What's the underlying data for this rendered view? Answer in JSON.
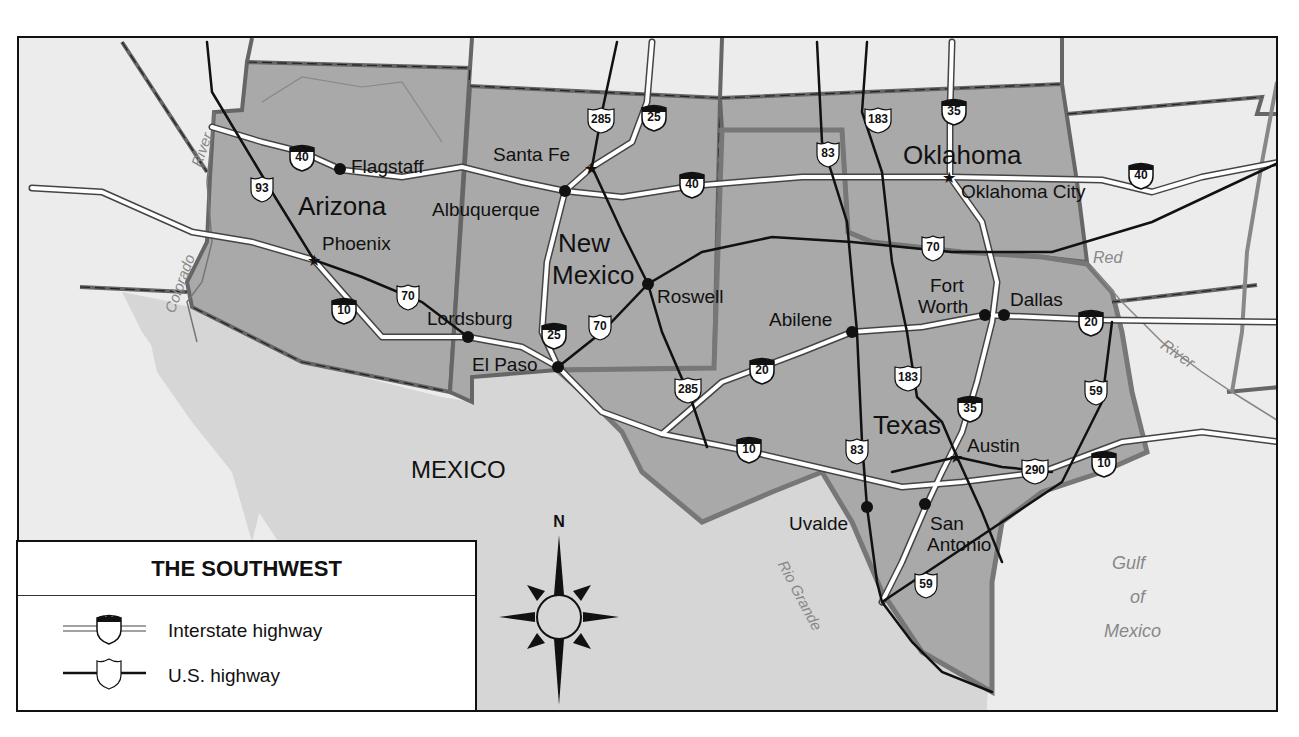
{
  "map": {
    "title": "THE SOUTHWEST",
    "colors": {
      "highlighted_states": "#a9a9a9",
      "neighbor_states": "#ececec",
      "mexico": "#d6d6d6",
      "water": "#ececec",
      "interstate_road": "#ffffff",
      "us_highway": "#111111",
      "border": "#555555",
      "river": "#888888"
    },
    "states": [
      {
        "id": "arizona",
        "label": "Arizona"
      },
      {
        "id": "new-mexico",
        "label_line1": "New",
        "label_line2": "Mexico"
      },
      {
        "id": "oklahoma",
        "label": "Oklahoma"
      },
      {
        "id": "texas",
        "label": "Texas"
      }
    ],
    "country_label": "MEXICO",
    "water_labels": {
      "gulf_line1": "Gulf",
      "gulf_line2": "of",
      "gulf_line3": "Mexico",
      "colorado_river_1": "River",
      "colorado_river_2": "Colorado",
      "red_river_1": "Red",
      "red_river_2": "River",
      "rio_grande": "Rio Grande"
    },
    "cities": [
      {
        "name": "Flagstaff",
        "capital": false
      },
      {
        "name": "Phoenix",
        "capital": true
      },
      {
        "name": "Lordsburg",
        "capital": false
      },
      {
        "name": "Santa Fe",
        "capital": true
      },
      {
        "name": "Albuquerque",
        "capital": false
      },
      {
        "name": "Roswell",
        "capital": false
      },
      {
        "name": "El Paso",
        "capital": false
      },
      {
        "name": "Oklahoma City",
        "capital": true
      },
      {
        "name": "Abilene",
        "capital": false
      },
      {
        "name": "Fort",
        "name2": "Worth",
        "capital": false
      },
      {
        "name": "Dallas",
        "capital": false
      },
      {
        "name": "Austin",
        "capital": true
      },
      {
        "name": "Uvalde",
        "capital": false
      },
      {
        "name": "San",
        "name2": "Antonio",
        "capital": false
      }
    ],
    "interstate_shields": [
      "40",
      "10",
      "25",
      "25",
      "40",
      "35",
      "40",
      "20",
      "20",
      "10",
      "35",
      "10"
    ],
    "us_shields": [
      "93",
      "70",
      "285",
      "70",
      "285",
      "183",
      "83",
      "70",
      "183",
      "83",
      "59",
      "290",
      "59"
    ],
    "compass": {
      "north_label": "N"
    }
  },
  "legend": {
    "title": "THE SOUTHWEST",
    "items": [
      {
        "symbol": "interstate-highway",
        "label": "Interstate highway"
      },
      {
        "symbol": "us-highway",
        "label": "U.S. highway"
      }
    ]
  }
}
